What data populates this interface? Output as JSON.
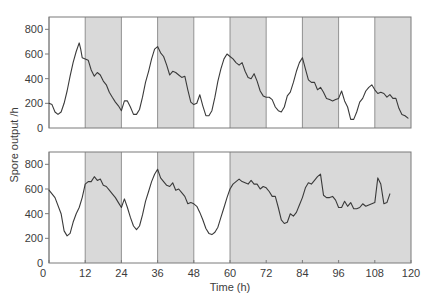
{
  "chart_data": [
    {
      "type": "line",
      "panel": "top",
      "title": "",
      "xlabel": "Time (h)",
      "ylabel": "Spore output /h",
      "xlim": [
        0,
        120
      ],
      "ylim": [
        0,
        900
      ],
      "yticks": [
        0,
        200,
        400,
        600,
        800
      ],
      "xticks": [],
      "grid": false,
      "light_dark_bands": [
        {
          "start": 0,
          "end": 12,
          "phase": "light"
        },
        {
          "start": 12,
          "end": 24,
          "phase": "dark"
        },
        {
          "start": 24,
          "end": 36,
          "phase": "light"
        },
        {
          "start": 36,
          "end": 48,
          "phase": "dark"
        },
        {
          "start": 48,
          "end": 60,
          "phase": "light"
        },
        {
          "start": 60,
          "end": 72,
          "phase": "dark"
        },
        {
          "start": 72,
          "end": 84,
          "phase": "light"
        },
        {
          "start": 84,
          "end": 96,
          "phase": "dark"
        },
        {
          "start": 96,
          "end": 108,
          "phase": "light"
        },
        {
          "start": 108,
          "end": 120,
          "phase": "dark"
        }
      ],
      "series": [
        {
          "name": "Spore output (light/dark cycles continue)",
          "x": [
            0,
            1,
            2,
            3,
            4,
            5,
            6,
            7,
            8,
            9,
            10,
            10.5,
            11,
            12,
            13,
            14,
            15,
            16,
            17,
            18,
            19,
            20,
            21,
            22,
            23,
            24,
            25,
            26,
            27,
            28,
            29,
            30,
            31,
            32,
            33,
            34,
            35,
            36,
            37,
            38,
            39,
            40,
            41,
            42,
            43,
            44,
            45,
            46,
            47,
            48,
            49,
            50,
            51,
            52,
            53,
            54,
            55,
            56,
            57,
            58,
            59,
            60,
            61,
            62,
            63,
            64,
            65,
            66,
            67,
            68,
            69,
            70,
            71,
            72,
            73,
            74,
            75,
            76,
            77,
            78,
            79,
            80,
            81,
            82,
            83,
            84,
            85,
            86,
            87,
            88,
            89,
            90,
            91,
            92,
            93,
            94,
            95,
            96,
            97,
            98,
            99,
            100,
            101,
            102,
            103,
            104,
            105,
            106,
            107,
            108,
            109,
            110,
            111,
            112,
            113,
            114,
            115,
            116,
            117,
            118,
            119
          ],
          "values": [
            200,
            190,
            130,
            110,
            130,
            200,
            300,
            420,
            530,
            620,
            690,
            640,
            570,
            560,
            550,
            470,
            420,
            450,
            430,
            380,
            350,
            290,
            250,
            210,
            180,
            140,
            220,
            220,
            170,
            110,
            110,
            150,
            250,
            370,
            460,
            560,
            640,
            660,
            610,
            580,
            510,
            430,
            460,
            450,
            430,
            410,
            420,
            310,
            210,
            190,
            200,
            270,
            180,
            100,
            100,
            140,
            250,
            380,
            480,
            560,
            600,
            580,
            560,
            530,
            510,
            530,
            460,
            410,
            400,
            440,
            380,
            300,
            260,
            250,
            250,
            230,
            170,
            140,
            130,
            170,
            260,
            290,
            370,
            460,
            530,
            570,
            480,
            390,
            370,
            370,
            310,
            330,
            290,
            240,
            230,
            220,
            230,
            240,
            300,
            220,
            170,
            70,
            70,
            130,
            210,
            240,
            300,
            330,
            350,
            310,
            280,
            290,
            280,
            250,
            270,
            240,
            240,
            160,
            110,
            100,
            80
          ]
        }
      ]
    },
    {
      "type": "line",
      "panel": "bottom",
      "title": "",
      "xlabel": "Time (h)",
      "ylabel": "Spore output /h",
      "xlim": [
        0,
        120
      ],
      "ylim": [
        0,
        900
      ],
      "yticks": [
        0,
        200,
        400,
        600,
        800
      ],
      "xticks": [
        0,
        12,
        24,
        36,
        48,
        60,
        72,
        84,
        96,
        108,
        120
      ],
      "grid": false,
      "light_dark_bands": [
        {
          "start": 0,
          "end": 12,
          "phase": "light"
        },
        {
          "start": 12,
          "end": 24,
          "phase": "dark"
        },
        {
          "start": 24,
          "end": 36,
          "phase": "light"
        },
        {
          "start": 36,
          "end": 48,
          "phase": "dark"
        },
        {
          "start": 48,
          "end": 60,
          "phase": "light"
        },
        {
          "start": 60,
          "end": 120,
          "phase": "dark"
        }
      ],
      "series": [
        {
          "name": "Spore output (continuous darkness after 60 h)",
          "x": [
            0,
            2,
            4,
            5,
            6,
            7,
            8,
            9,
            10,
            11,
            12,
            13,
            14,
            15,
            16,
            17,
            18,
            19,
            20,
            21,
            22,
            23,
            24,
            25,
            26,
            27,
            28,
            29,
            30,
            31,
            32,
            33,
            34,
            35,
            36,
            37,
            38,
            39,
            40,
            41,
            42,
            43,
            44,
            45,
            46,
            47,
            48,
            49,
            50,
            51,
            52,
            53,
            54,
            55,
            56,
            57,
            58,
            59,
            60,
            61,
            62,
            63,
            64,
            65,
            66,
            67,
            68,
            69,
            70,
            71,
            72,
            73,
            74,
            75,
            76,
            77,
            78,
            79,
            80,
            81,
            82,
            83,
            84,
            85,
            86,
            87,
            88,
            89,
            90,
            91,
            92,
            93,
            94,
            95,
            96,
            97,
            98,
            99,
            100,
            101,
            102,
            103,
            104,
            105,
            106,
            107,
            108,
            109,
            110,
            111,
            112,
            113
          ],
          "values": [
            590,
            530,
            400,
            260,
            220,
            240,
            330,
            400,
            450,
            530,
            640,
            660,
            660,
            700,
            670,
            680,
            630,
            620,
            590,
            560,
            530,
            490,
            450,
            520,
            450,
            370,
            300,
            270,
            300,
            390,
            500,
            580,
            660,
            720,
            760,
            690,
            660,
            630,
            620,
            650,
            590,
            600,
            570,
            540,
            480,
            490,
            480,
            460,
            410,
            350,
            280,
            240,
            230,
            250,
            290,
            370,
            450,
            530,
            600,
            640,
            660,
            680,
            660,
            650,
            640,
            670,
            640,
            640,
            600,
            620,
            610,
            580,
            540,
            540,
            450,
            350,
            320,
            330,
            400,
            380,
            410,
            470,
            530,
            610,
            650,
            640,
            670,
            700,
            720,
            550,
            530,
            530,
            540,
            510,
            450,
            450,
            500,
            460,
            490,
            440,
            440,
            450,
            480,
            460,
            470,
            480,
            490,
            690,
            640,
            480,
            490,
            560
          ]
        }
      ]
    }
  ],
  "labels": {
    "ylabel": "Spore output /h",
    "xlabel": "Time (h)",
    "ytick_labels": [
      "0",
      "200",
      "400",
      "600",
      "800"
    ],
    "xtick_labels": [
      "0",
      "12",
      "24",
      "36",
      "48",
      "60",
      "72",
      "84",
      "96",
      "108",
      "120"
    ]
  },
  "colors": {
    "dark_band": "#d9d9d9",
    "light_band": "#ffffff",
    "line": "#3a3a3a",
    "frame": "#7a7a7a"
  }
}
